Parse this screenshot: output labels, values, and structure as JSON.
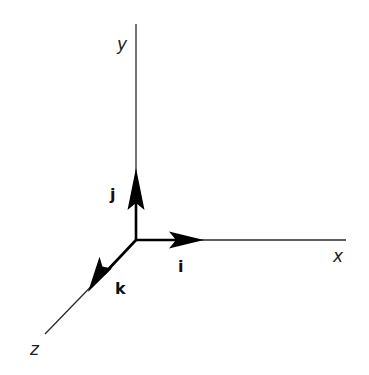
{
  "diagram": {
    "type": "3d-coordinate-axes-with-unit-vectors",
    "origin": [
      136,
      240
    ],
    "axes": [
      {
        "name": "x",
        "label": "x",
        "from": [
          136,
          240
        ],
        "to": [
          346,
          240
        ]
      },
      {
        "name": "y",
        "label": "y",
        "from": [
          136,
          240
        ],
        "to": [
          136,
          24
        ]
      },
      {
        "name": "z",
        "label": "z",
        "from": [
          136,
          240
        ],
        "to": [
          45,
          334
        ]
      }
    ],
    "unit_vectors": [
      {
        "name": "i",
        "label": "i",
        "direction": "x",
        "tip": [
          204,
          240
        ]
      },
      {
        "name": "j",
        "label": "j",
        "direction": "y",
        "tip": [
          136,
          168
        ]
      },
      {
        "name": "k",
        "label": "k",
        "direction": "z",
        "tip": [
          88,
          292
        ]
      }
    ],
    "colors": {
      "background": "#ffffff",
      "axis": "#2a2a2a",
      "vector": "#000000",
      "text": "#222222"
    }
  }
}
